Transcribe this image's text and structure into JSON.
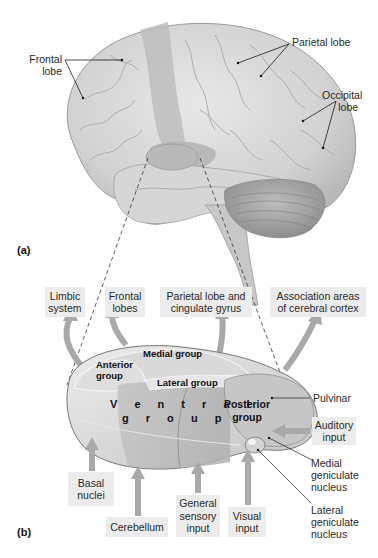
{
  "figure": {
    "panel_a": {
      "label": "(a)",
      "labels": {
        "frontal": [
          "Frontal",
          "lobe"
        ],
        "parietal": "Parietal lobe",
        "occipital": [
          "Occipital",
          "lobe"
        ]
      }
    },
    "panel_b": {
      "label": "(b)",
      "outputs": [
        {
          "id": "limbic",
          "lines": [
            "Limbic",
            "system"
          ]
        },
        {
          "id": "frontal",
          "lines": [
            "Frontal",
            "lobes"
          ]
        },
        {
          "id": "parietal",
          "lines": [
            "Parietal lobe and",
            "cingulate gyrus"
          ]
        },
        {
          "id": "association",
          "lines": [
            "Association areas",
            "of cerebral cortex"
          ]
        }
      ],
      "regions": {
        "medial": "Medial group",
        "anterior": [
          "Anterior",
          "group"
        ],
        "lateral": "Lateral group",
        "ventral": [
          "V e n t r a l",
          "g r o u p"
        ],
        "posterior": [
          "Posterior",
          "group"
        ]
      },
      "side_labels": {
        "pulvinar": "Pulvinar",
        "auditory": [
          "Auditory",
          "input"
        ],
        "medial_geniculate": [
          "Medial",
          "geniculate",
          "nucleus"
        ],
        "lateral_geniculate": [
          "Lateral",
          "geniculate",
          "nucleus"
        ]
      },
      "inputs": [
        {
          "id": "basal",
          "lines": [
            "Basal",
            "nuclei"
          ]
        },
        {
          "id": "cerebellum",
          "lines": [
            "Cerebellum"
          ]
        },
        {
          "id": "general",
          "lines": [
            "General",
            "sensory",
            "input"
          ]
        },
        {
          "id": "visual",
          "lines": [
            "Visual",
            "input"
          ]
        }
      ]
    },
    "colors": {
      "arrow": "#a9a9a9",
      "box": "#ececec",
      "thalamus_light": "#e4e4e4",
      "thalamus_mid": "#c8c8c8",
      "thalamus_dark": "#a8a8a8",
      "brain_light": "#dcdcdc",
      "brain_dark": "#b0b0b0"
    }
  }
}
